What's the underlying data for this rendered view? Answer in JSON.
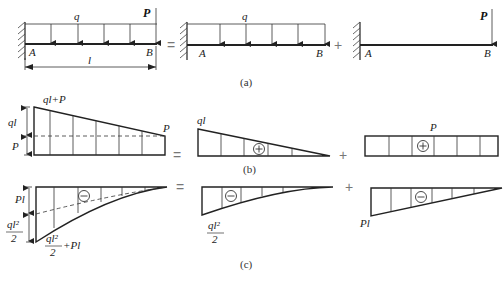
{
  "figure": {
    "part_a": {
      "caption": "(a)",
      "operators": [
        "=",
        "+"
      ],
      "beam1": {
        "load_label": "q",
        "force_label": "P",
        "left_label": "A",
        "right_label": "B",
        "length_label": "l"
      },
      "beam2": {
        "load_label": "q",
        "left_label": "A",
        "right_label": "B"
      },
      "beam3": {
        "force_label": "P",
        "left_label": "A",
        "right_label": "B"
      }
    },
    "part_b": {
      "caption": "(b)",
      "operators": [
        "=",
        "+"
      ],
      "diagram1": {
        "top_label": "ql+P",
        "dim_upper": "ql",
        "dim_lower": "P",
        "end_label": "P"
      },
      "diagram2": {
        "top_label": "ql",
        "sign": "+"
      },
      "diagram3": {
        "top_label": "P",
        "sign": "+"
      }
    },
    "part_c": {
      "caption": "(c)",
      "operators": [
        "=",
        "+"
      ],
      "diagram1": {
        "dim_upper": "Pl",
        "dim_lower_num": "ql²",
        "dim_lower_den": "2",
        "bottom_num": "ql²",
        "bottom_den": "2",
        "bottom_suffix": "+Pl",
        "sign": "−"
      },
      "diagram2": {
        "label_num": "ql²",
        "label_den": "2",
        "sign": "−"
      },
      "diagram3": {
        "label": "Pl",
        "sign": "−"
      }
    }
  }
}
